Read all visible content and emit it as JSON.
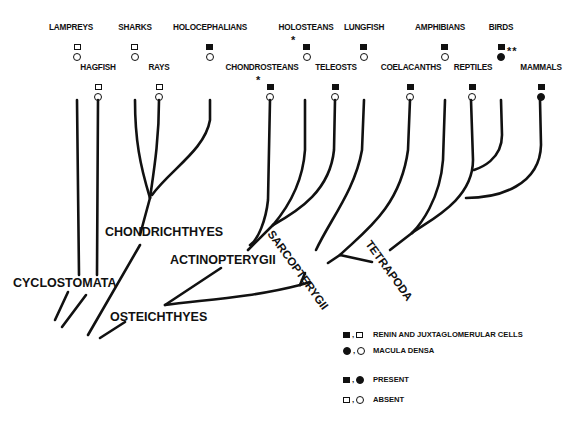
{
  "taxa_top_row": [
    {
      "name": "LAMPREYS",
      "x": 22,
      "renin": "absent",
      "macula": "absent",
      "note": ""
    },
    {
      "name": "SHARKS",
      "x": 135,
      "renin": "absent",
      "macula": "absent",
      "note": ""
    },
    {
      "name": "HOLOCEPHALIANS",
      "x": 210,
      "renin": "present",
      "macula": "absent",
      "note": ""
    },
    {
      "name": "HOLOSTEANS",
      "x": 308,
      "renin": "present",
      "macula": "absent",
      "note": "*"
    },
    {
      "name": "LUNGFISH",
      "x": 364,
      "renin": "present",
      "macula": "absent",
      "note": ""
    },
    {
      "name": "AMPHIBIANS",
      "x": 445,
      "renin": "present",
      "macula": "absent",
      "note": ""
    },
    {
      "name": "BIRDS",
      "x": 501,
      "renin": "present",
      "macula": "present",
      "note": "**"
    }
  ],
  "taxa_bottom_row": [
    {
      "name": "HAGFISH",
      "x": 98,
      "renin": "absent",
      "macula": "absent",
      "note": ""
    },
    {
      "name": "RAYS",
      "x": 159,
      "renin": "absent",
      "macula": "absent",
      "note": ""
    },
    {
      "name": "CHONDROSTEANS",
      "x": 270,
      "renin": "present",
      "macula": "absent",
      "note": "*"
    },
    {
      "name": "TELEOSTS",
      "x": 335,
      "renin": "present",
      "macula": "absent",
      "note": ""
    },
    {
      "name": "COELACANTHS",
      "x": 410,
      "renin": "present",
      "macula": "absent",
      "note": ""
    },
    {
      "name": "REPTILES",
      "x": 471,
      "renin": "present",
      "macula": "absent",
      "note": ""
    },
    {
      "name": "MAMMALS",
      "x": 540,
      "renin": "present",
      "macula": "present",
      "note": ""
    }
  ],
  "clades": {
    "cyclostomata": "CYCLOSTOMATA",
    "chondrichthyes": "CHONDRICHTHYES",
    "osteichthyes": "OSTEICHTHYES",
    "actinopterygii": "ACTINOPTERYGII",
    "sarcopterygii": "SARCOPTERYGII",
    "tetrapoda": "TETRAPODA"
  },
  "legend": {
    "renin": "RENIN AND JUXTAGLOMERULAR CELLS",
    "macula": "MACULA DENSA",
    "present": "PRESENT",
    "absent": "ABSENT",
    "symbols": {
      "renin": "square-icon",
      "macula": "circle-icon",
      "filled": "present",
      "open": "absent"
    }
  },
  "colors": {
    "ink": "#111111",
    "background": "#ffffff"
  }
}
